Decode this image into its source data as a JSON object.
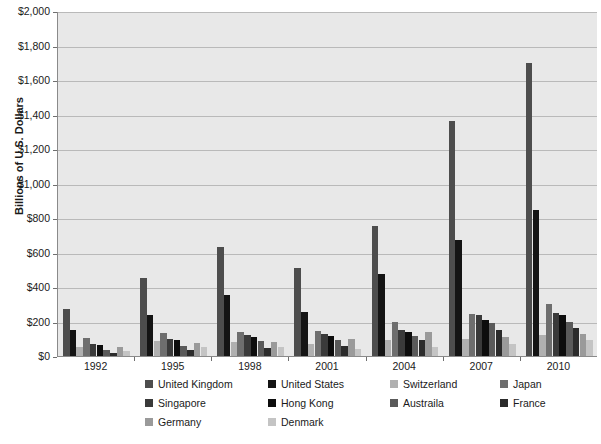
{
  "chart_data": {
    "type": "bar",
    "title": "",
    "xlabel": "",
    "ylabel": "Billions of U.S. Dollars",
    "categories": [
      "1992",
      "1995",
      "1998",
      "2001",
      "2004",
      "2007",
      "2010"
    ],
    "ylim": [
      0,
      2000
    ],
    "ytick_labels": [
      "$0",
      "$200",
      "$400",
      "$600",
      "$800",
      "$1,000",
      "$1,200",
      "$1,400",
      "$1,600",
      "$1,800",
      "$2,000"
    ],
    "ytick_values": [
      0,
      200,
      400,
      600,
      800,
      1000,
      1200,
      1400,
      1600,
      1800,
      2000
    ],
    "grid": true,
    "legend_position": "bottom",
    "series": [
      {
        "name": "United Kingdom",
        "color": "#4d4d4d",
        "values": [
          275,
          455,
          630,
          510,
          755,
          1360,
          1700
        ]
      },
      {
        "name": "United States",
        "color": "#141414",
        "values": [
          150,
          235,
          355,
          255,
          475,
          670,
          845
        ]
      },
      {
        "name": "Switzerland",
        "color": "#b0b0b0",
        "values": [
          55,
          85,
          80,
          70,
          90,
          100,
          120
        ]
      },
      {
        "name": "Japan",
        "color": "#6e6e6e",
        "values": [
          105,
          135,
          140,
          145,
          200,
          245,
          300
        ]
      },
      {
        "name": "Singapore",
        "color": "#3a3a3a",
        "values": [
          70,
          100,
          120,
          125,
          150,
          235,
          250
        ]
      },
      {
        "name": "Hong Kong",
        "color": "#0d0d0d",
        "values": [
          65,
          95,
          110,
          115,
          140,
          210,
          235
        ]
      },
      {
        "name": "Austraila",
        "color": "#5a5a5a",
        "values": [
          35,
          60,
          85,
          95,
          115,
          190,
          200
        ]
      },
      {
        "name": "France",
        "color": "#2b2b2b",
        "values": [
          20,
          35,
          45,
          60,
          95,
          150,
          165
        ]
      },
      {
        "name": "Germany",
        "color": "#9a9a9a",
        "values": [
          50,
          75,
          80,
          100,
          140,
          110,
          130
        ]
      },
      {
        "name": "Denmark",
        "color": "#c4c4c4",
        "values": [
          30,
          50,
          55,
          40,
          55,
          70,
          95
        ]
      }
    ]
  },
  "legend": {
    "rows": [
      [
        {
          "label": "United Kingdom",
          "color": "#4d4d4d"
        },
        {
          "label": "United States",
          "color": "#141414"
        },
        {
          "label": "Switzerland",
          "color": "#b0b0b0"
        },
        {
          "label": "Japan",
          "color": "#6e6e6e"
        }
      ],
      [
        {
          "label": "Singapore",
          "color": "#3a3a3a"
        },
        {
          "label": "Hong Kong",
          "color": "#0d0d0d"
        },
        {
          "label": "Austraila",
          "color": "#5a5a5a"
        },
        {
          "label": "France",
          "color": "#2b2b2b"
        }
      ],
      [
        {
          "label": "Germany",
          "color": "#9a9a9a"
        },
        {
          "label": "Denmark",
          "color": "#c4c4c4"
        }
      ]
    ]
  },
  "colors": {
    "plot_background": "#e8e8e8",
    "page_background": "#ffffff",
    "gridline": "#b9b9b9",
    "axis": "#8a8a8a",
    "text": "#1a1a1a"
  }
}
